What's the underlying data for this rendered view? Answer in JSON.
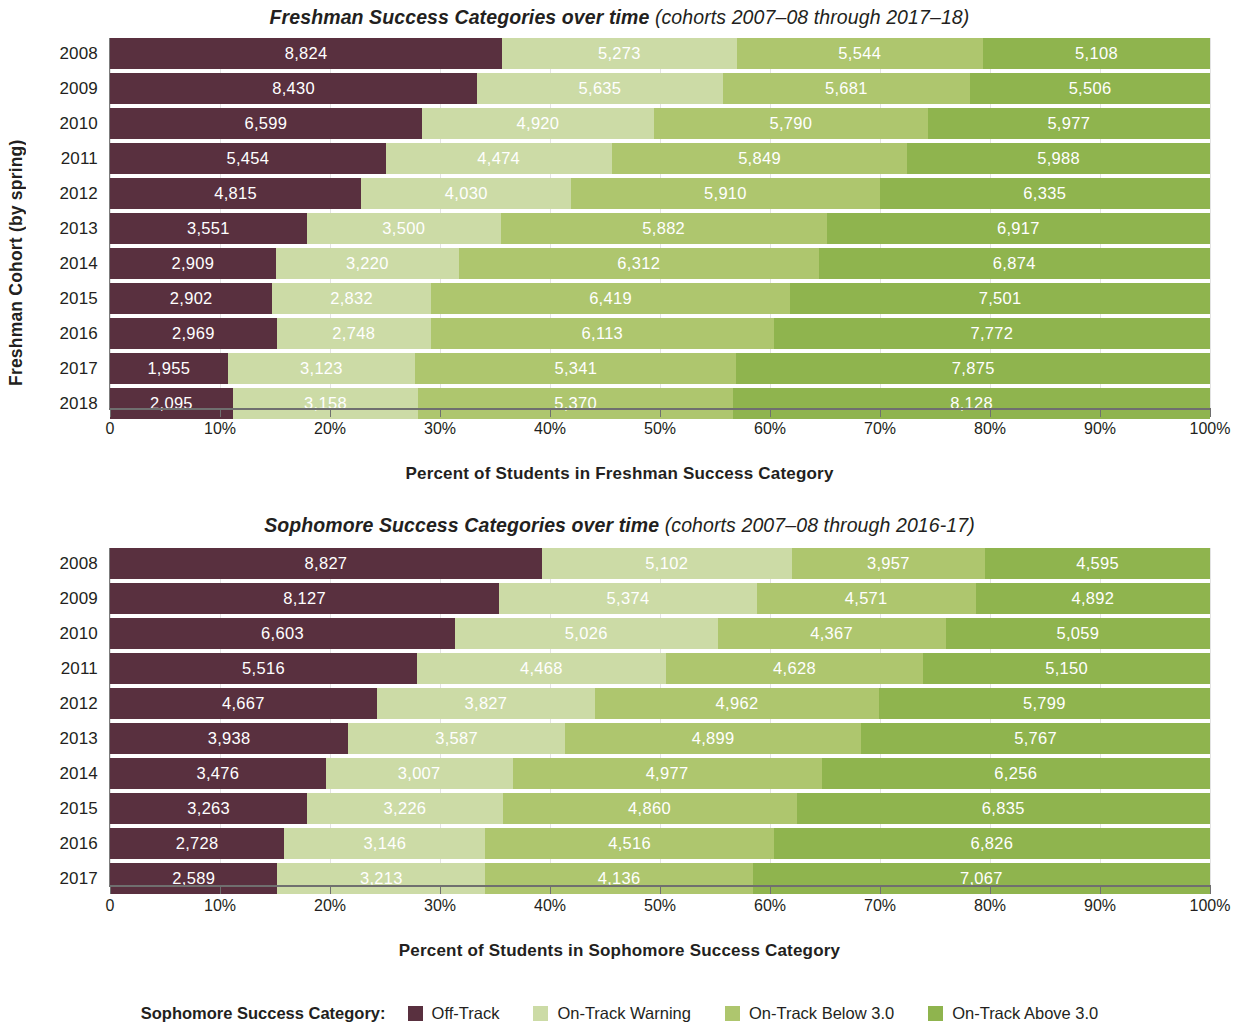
{
  "colors": {
    "off_track": "#59303f",
    "on_track_warning": "#ccdba6",
    "on_track_below_3": "#aec66e",
    "on_track_above_3": "#8fb44e",
    "axis": "#6f6f6f",
    "gridline": "#e3e3e3",
    "text": "#231f20",
    "value_label": "#ffffff"
  },
  "legend": {
    "title": "Sophomore Success Category:",
    "items": [
      {
        "label": "Off-Track",
        "color": "#59303f",
        "key": "off_track"
      },
      {
        "label": "On-Track Warning",
        "color": "#ccdba6",
        "key": "on_track_warning"
      },
      {
        "label": "On-Track Below 3.0",
        "color": "#aec66e",
        "key": "on_track_below_3"
      },
      {
        "label": "On-Track Above 3.0",
        "color": "#8fb44e",
        "key": "on_track_above_3"
      }
    ]
  },
  "axis": {
    "ticks": [
      "0",
      "10%",
      "20%",
      "30%",
      "40%",
      "50%",
      "60%",
      "70%",
      "80%",
      "90%",
      "100%"
    ],
    "tick_values": [
      0,
      10,
      20,
      30,
      40,
      50,
      60,
      70,
      80,
      90,
      100
    ]
  },
  "freshman": {
    "title_main": "Freshman Success Categories over time",
    "title_sub": "(cohorts 2007–08 through 2017–18)",
    "ylabel": "Freshman Cohort (by spring)",
    "xlabel": "Percent of Students in Freshman Success Category"
  },
  "sophomore": {
    "title_main": "Sophomore Success Categories over time",
    "title_sub": "(cohorts 2007–08 through 2016-17)",
    "ylabel": "Freshman Cohort (by spring)",
    "xlabel": "Percent of Students in Sophomore Success Category"
  },
  "chart_data": [
    {
      "type": "bar",
      "orientation": "horizontal",
      "stacked": true,
      "normalized": "percent",
      "title": "Freshman Success Categories over time (cohorts 2007–08 through 2017–18)",
      "xlabel": "Percent of Students in Freshman Success Category",
      "ylabel": "Freshman Cohort (by spring)",
      "xlim": [
        0,
        100
      ],
      "xticks": [
        0,
        10,
        20,
        30,
        40,
        50,
        60,
        70,
        80,
        90,
        100
      ],
      "grid": true,
      "legend_position": "bottom",
      "categories": [
        "2008",
        "2009",
        "2010",
        "2011",
        "2012",
        "2013",
        "2014",
        "2015",
        "2016",
        "2017",
        "2018"
      ],
      "series": [
        {
          "name": "Off-Track",
          "color": "#59303f",
          "values": [
            8824,
            8430,
            6599,
            5454,
            4815,
            3551,
            2909,
            2902,
            2969,
            1955,
            2095
          ]
        },
        {
          "name": "On-Track Warning",
          "color": "#ccdba6",
          "values": [
            5273,
            5635,
            4920,
            4474,
            4030,
            3500,
            3220,
            2832,
            2748,
            3123,
            3158
          ]
        },
        {
          "name": "On-Track Below 3.0",
          "color": "#aec66e",
          "values": [
            5544,
            5681,
            5790,
            5849,
            5910,
            5882,
            6312,
            6419,
            6113,
            5341,
            5370
          ]
        },
        {
          "name": "On-Track Above 3.0",
          "color": "#8fb44e",
          "values": [
            5108,
            5506,
            5977,
            5988,
            6335,
            6917,
            6874,
            7501,
            7772,
            7875,
            8128
          ]
        }
      ]
    },
    {
      "type": "bar",
      "orientation": "horizontal",
      "stacked": true,
      "normalized": "percent",
      "title": "Sophomore Success Categories over time (cohorts 2007–08 through 2016-17)",
      "xlabel": "Percent of Students in Sophomore Success Category",
      "ylabel": "Freshman Cohort (by spring)",
      "xlim": [
        0,
        100
      ],
      "xticks": [
        0,
        10,
        20,
        30,
        40,
        50,
        60,
        70,
        80,
        90,
        100
      ],
      "grid": true,
      "legend_position": "bottom",
      "categories": [
        "2008",
        "2009",
        "2010",
        "2011",
        "2012",
        "2013",
        "2014",
        "2015",
        "2016",
        "2017"
      ],
      "series": [
        {
          "name": "Off-Track",
          "color": "#59303f",
          "values": [
            8827,
            8127,
            6603,
            5516,
            4667,
            3938,
            3476,
            3263,
            2728,
            2589
          ]
        },
        {
          "name": "On-Track Warning",
          "color": "#ccdba6",
          "values": [
            5102,
            5374,
            5026,
            4468,
            3827,
            3587,
            3007,
            3226,
            3146,
            3213
          ]
        },
        {
          "name": "On-Track Below 3.0",
          "color": "#aec66e",
          "values": [
            3957,
            4571,
            4367,
            4628,
            4962,
            4899,
            4977,
            4860,
            4516,
            4136
          ]
        },
        {
          "name": "On-Track Above 3.0",
          "color": "#8fb44e",
          "values": [
            4595,
            4892,
            5059,
            5150,
            5799,
            5767,
            6256,
            6835,
            6826,
            7067
          ]
        }
      ]
    }
  ]
}
